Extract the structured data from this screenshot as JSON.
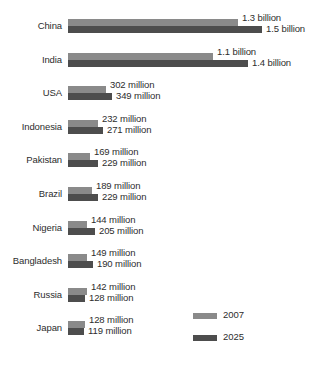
{
  "chart_data": {
    "type": "bar",
    "orientation": "horizontal",
    "title": "",
    "xlabel": "",
    "ylabel": "",
    "grid": false,
    "legend_position": "bottom-right",
    "categories": [
      "China",
      "India",
      "USA",
      "Indonesia",
      "Pakistan",
      "Brazil",
      "Nigeria",
      "Bangladesh",
      "Russia",
      "Japan"
    ],
    "series": [
      {
        "name": "2007",
        "color": "#8a8a8a",
        "values": [
          1300,
          1100,
          302,
          232,
          169,
          189,
          144,
          149,
          142,
          128
        ],
        "labels": [
          "1.3 billion",
          "1.1 billion",
          "302 million",
          "232 million",
          "169 million",
          "189 million",
          "144 million",
          "149 million",
          "142 million",
          "128 million"
        ]
      },
      {
        "name": "2025",
        "color": "#4d4d4d",
        "values": [
          1500,
          1400,
          349,
          271,
          229,
          229,
          205,
          190,
          128,
          119
        ],
        "labels": [
          "1.5 billion",
          "1.4 billion",
          "349 million",
          "271 million",
          "229 million",
          "229 million",
          "205 million",
          "190 million",
          "128 million",
          "119 million"
        ]
      }
    ],
    "unit_note": "values in millions",
    "xlim": [
      0,
      1500
    ]
  },
  "rows": [
    {
      "country": "China",
      "bar2007": {
        "label": "1.3 billion",
        "width": 170
      },
      "bar2025": {
        "label": "1.5 billion",
        "width": 194
      }
    },
    {
      "country": "India",
      "bar2007": {
        "label": "1.1 billion",
        "width": 145
      },
      "bar2025": {
        "label": "1.4 billion",
        "width": 180
      }
    },
    {
      "country": "USA",
      "bar2007": {
        "label": "302 million",
        "width": 38
      },
      "bar2025": {
        "label": "349 million",
        "width": 44
      }
    },
    {
      "country": "Indonesia",
      "bar2007": {
        "label": "232 million",
        "width": 30
      },
      "bar2025": {
        "label": "271 million",
        "width": 35
      }
    },
    {
      "country": "Pakistan",
      "bar2007": {
        "label": "169 million",
        "width": 22
      },
      "bar2025": {
        "label": "229 million",
        "width": 30
      }
    },
    {
      "country": "Brazil",
      "bar2007": {
        "label": "189 million",
        "width": 24
      },
      "bar2025": {
        "label": "229 million",
        "width": 30
      }
    },
    {
      "country": "Nigeria",
      "bar2007": {
        "label": "144 million",
        "width": 19
      },
      "bar2025": {
        "label": "205 million",
        "width": 27
      }
    },
    {
      "country": "Bangladesh",
      "bar2007": {
        "label": "149 million",
        "width": 19
      },
      "bar2025": {
        "label": "190 million",
        "width": 25
      }
    },
    {
      "country": "Russia",
      "bar2007": {
        "label": "142 million",
        "width": 19
      },
      "bar2025": {
        "label": "128 million",
        "width": 17
      }
    },
    {
      "country": "Japan",
      "bar2007": {
        "label": "128 million",
        "width": 17
      },
      "bar2025": {
        "label": "119 million",
        "width": 16
      }
    }
  ],
  "legend": {
    "items": [
      {
        "label": "2007",
        "color": "#8a8a8a"
      },
      {
        "label": "2025",
        "color": "#4d4d4d"
      }
    ]
  }
}
